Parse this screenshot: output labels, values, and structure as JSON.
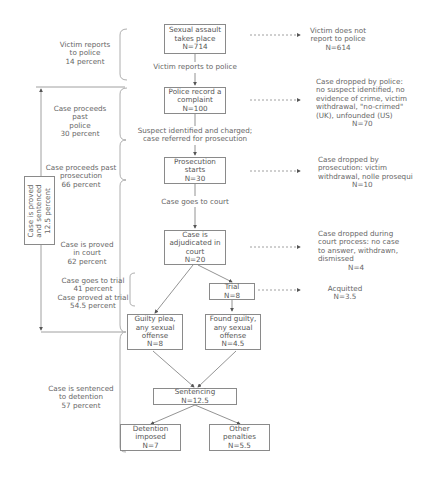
{
  "boxes": {
    "assault": [
      "Sexual assault",
      "takes place",
      "N=714"
    ],
    "police": [
      "Police record a",
      "complaint",
      "N=100"
    ],
    "prosecution": [
      "Prosecution",
      "starts",
      "N=30"
    ],
    "adjudicated": [
      "Case is",
      "adjudicated in",
      "court",
      "N=20"
    ],
    "trial": [
      "Trial",
      "N=8"
    ],
    "guilty_plea": [
      "Guilty plea,",
      "any sexual",
      "offense",
      "N=8"
    ],
    "found_guilty": [
      "Found guilty,",
      "any sexual",
      "offense",
      "N=4.5"
    ],
    "sentencing": [
      "Sentencing",
      "N=12.5"
    ],
    "detention": [
      "Detention",
      "imposed",
      "N=7"
    ],
    "other": [
      "Other",
      "penalties",
      "N=5.5"
    ]
  },
  "flow_labels": {
    "reports": "Victim reports to police",
    "charged": [
      "Suspect identified and charged;",
      "case referred for prosecution"
    ],
    "to_court": "Case goes to court"
  },
  "outcomes": {
    "no_report": [
      "Victim does not",
      "report to police",
      "N=614"
    ],
    "dropped_police": [
      "Case dropped by police:",
      "no suspect identified, no",
      "evidence of crime, victim",
      "withdrawal, \"no-crimed\"",
      "(UK), unfounded (US)",
      "N=70"
    ],
    "dropped_prosecution": [
      "Case dropped by",
      "prosecution: victim",
      "withdrawal, nolle prosequi",
      "N=10"
    ],
    "dropped_court": [
      "Case dropped during",
      "court process: no case",
      "to answer, withdrawn,",
      "dismissed",
      "N=4"
    ],
    "acquitted": [
      "Acquitted",
      "N=3.5"
    ]
  },
  "side_labels": {
    "reports": [
      "Victim reports",
      "to police",
      "14 percent"
    ],
    "past_police": [
      "Case proceeds past",
      "police",
      "30 percent"
    ],
    "past_prosecution": [
      "Case proceeds past",
      "prosecution",
      "66 percent"
    ],
    "proved": [
      "Case is proved",
      "in court",
      "62 percent"
    ],
    "trial": [
      "Case goes to trial",
      "41 percent",
      "Case proved at trial",
      "54.5 percent"
    ],
    "sentenced": [
      "Case is sentenced",
      "to detention",
      "57 percent"
    ],
    "overall": [
      "Case is proved",
      "and sentenced",
      "12.5 percent"
    ]
  }
}
